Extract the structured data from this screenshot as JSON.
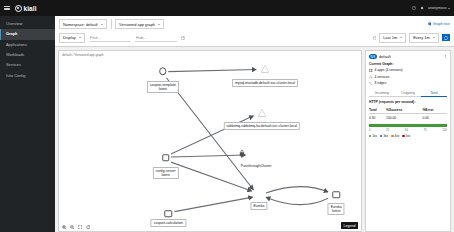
{
  "masthead": {
    "menu_icon": "hamburger-icon",
    "brand": "kiali",
    "help_icon": "help-icon",
    "notifications_icon": "bell-icon",
    "user_label": "anonymous"
  },
  "sidebar": {
    "items": [
      {
        "label": "Overview",
        "active": false
      },
      {
        "label": "Graph",
        "active": true
      },
      {
        "label": "Applications",
        "active": false
      },
      {
        "label": "Workloads",
        "active": false
      },
      {
        "label": "Services",
        "active": false
      },
      {
        "label": "Istio Config",
        "active": false
      }
    ]
  },
  "toolbar": {
    "namespace_select": "Namespace: default",
    "graph_type_select": "Versioned app graph",
    "display_button": "Display",
    "find_placeholder": "Find...",
    "hide_placeholder": "Hide...",
    "help_icon": "question-circle-icon",
    "tour_link": "Graph tour",
    "duration_select": "Last 1m",
    "refresh_interval_select": "Every 1m",
    "refresh_icon": "sync-icon"
  },
  "graph": {
    "breadcrumb": "default / Versioned app graph",
    "nodes": [
      {
        "id": "coupon-template",
        "label": "coupon-template\nlatest",
        "label_line1": "coupon-template",
        "label_line2": "latest",
        "kind": "workload",
        "x": 117,
        "y": 20,
        "label_x": 117,
        "label_y": 25
      },
      {
        "id": "mysql",
        "label": "mysql-mariadb.default.svc.cluster.local",
        "kind": "service",
        "x": 232,
        "y": 18,
        "label_x": 232,
        "label_y": 24
      },
      {
        "id": "rabbitmq",
        "label": "rabbitmq-rabbitmq-ha.default.svc.cluster.local",
        "kind": "service",
        "x": 228,
        "y": 60,
        "label_x": 228,
        "label_y": 66
      },
      {
        "id": "config-server",
        "label": "config-server\nlatest",
        "label_line1": "config-server",
        "label_line2": "latest",
        "kind": "workload",
        "x": 120,
        "y": 104,
        "label_x": 120,
        "label_y": 109
      },
      {
        "id": "passthrough",
        "label": "PassthroughCluster",
        "kind": "service",
        "x": 220,
        "y": 102,
        "label_x": 222,
        "label_y": 108
      },
      {
        "id": "coupon-calculation",
        "label": "coupon-calculation",
        "kind": "workload",
        "x": 123,
        "y": 158,
        "label_x": 123,
        "label_y": 163
      },
      {
        "id": "eureka-svc",
        "label": "Eureka",
        "kind": "service",
        "x": 225,
        "y": 140,
        "label_x": 225,
        "label_y": 147
      },
      {
        "id": "eureka-wl",
        "label": "Eureka\nlatest",
        "label_line1": "Eureka",
        "label_line2": "latest",
        "kind": "workload",
        "x": 312,
        "y": 140,
        "label_x": 312,
        "label_y": 146
      }
    ],
    "edges": [
      {
        "from": "coupon-template",
        "to": "mysql"
      },
      {
        "from": "coupon-template",
        "to": "eureka-svc"
      },
      {
        "from": "config-server",
        "to": "rabbitmq"
      },
      {
        "from": "config-server",
        "to": "passthrough"
      },
      {
        "from": "config-server",
        "to": "eureka-svc"
      },
      {
        "from": "coupon-calculation",
        "to": "eureka-svc"
      },
      {
        "from": "eureka-svc",
        "to": "eureka-wl"
      },
      {
        "from": "eureka-wl",
        "to": "eureka-svc"
      }
    ],
    "controls": {
      "zoom_in": "zoom-in-icon",
      "zoom_out": "zoom-out-icon",
      "fit_to_screen": "expand-icon",
      "reset": "reset-icon",
      "legend_button": "Legend"
    }
  },
  "side_panel": {
    "namespace_badge": "NS",
    "title": "default",
    "kebab_icon": "kebab-icon",
    "summary_heading": "Current Graph:",
    "summary_items": [
      {
        "icon": "app-icon",
        "text": "4 apps (4 versions)"
      },
      {
        "icon": "service-icon",
        "text": "4 services"
      },
      {
        "icon": "edge-icon",
        "text": "8 edges"
      }
    ],
    "tabs": [
      {
        "label": "Incoming",
        "active": false
      },
      {
        "label": "Outgoing",
        "active": false
      },
      {
        "label": "Total",
        "active": true
      }
    ],
    "table_heading": "HTTP (requests per second):",
    "table_headers": [
      "Total",
      "%Success",
      "%Error"
    ],
    "table_rows": [
      [
        "0.30",
        "100.00",
        "0.00"
      ]
    ],
    "bar_axis": [
      "0",
      "25",
      "50",
      "75",
      "100"
    ],
    "bar_legend": [
      {
        "label": "2xx",
        "color": "#3f9c35"
      },
      {
        "label": "3xx",
        "color": "#00659c"
      },
      {
        "label": "4xx",
        "color": "#ec7a08"
      },
      {
        "label": "5xx",
        "color": "#cc0000"
      }
    ],
    "bar_value": 100,
    "bar_color": "#3f9c35"
  },
  "colors": {
    "accent": "#06c",
    "masthead_bg": "#151515",
    "sidebar_bg": "#212427",
    "success": "#3f9c35",
    "canvas_bg": "#ffffff"
  }
}
